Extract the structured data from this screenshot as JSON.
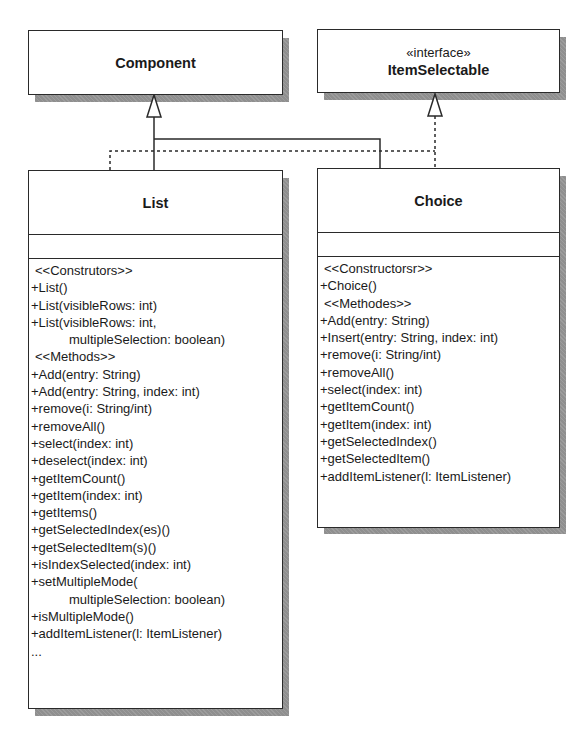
{
  "diagram": {
    "type": "UML class diagram",
    "classes": {
      "component": {
        "name": "Component"
      },
      "item_selectable": {
        "stereotype": "«interface»",
        "name": "ItemSelectable"
      },
      "list": {
        "name": "List",
        "attributes": [],
        "operations": [
          {
            "text": "<<Construtors>>",
            "kind": "stereotype"
          },
          {
            "text": "+List()"
          },
          {
            "text": "+List(visibleRows: int)"
          },
          {
            "text": "+List(visibleRows: int,"
          },
          {
            "text": "multipleSelection: boolean)",
            "kind": "continuation"
          },
          {
            "text": "<<Methods>>",
            "kind": "stereotype"
          },
          {
            "text": "+Add(entry: String)"
          },
          {
            "text": "+Add(entry: String, index: int)"
          },
          {
            "text": "+remove(i: String/int)"
          },
          {
            "text": "+removeAll()"
          },
          {
            "text": "+select(index: int)"
          },
          {
            "text": "+deselect(index: int)"
          },
          {
            "text": "+getItemCount()"
          },
          {
            "text": "+getItem(index: int)"
          },
          {
            "text": "+getItems()"
          },
          {
            "text": "+getSelectedIndex(es)()"
          },
          {
            "text": "+getSelectedItem(s)()"
          },
          {
            "text": "+isIndexSelected(index: int)"
          },
          {
            "text": "+setMultipleMode("
          },
          {
            "text": "multipleSelection: boolean)",
            "kind": "continuation"
          },
          {
            "text": "+isMultipleMode()"
          },
          {
            "text": "+addItemListener(l: ItemListener)"
          },
          {
            "text": "..."
          }
        ]
      },
      "choice": {
        "name": "Choice",
        "attributes": [],
        "operations": [
          {
            "text": "<<Constructorsr>>",
            "kind": "stereotype"
          },
          {
            "text": "+Choice()"
          },
          {
            "text": "<<Methodes>>",
            "kind": "stereotype"
          },
          {
            "text": "+Add(entry: String)"
          },
          {
            "text": "+Insert(entry: String, index: int)"
          },
          {
            "text": "+remove(i: String/int)"
          },
          {
            "text": "+removeAll()"
          },
          {
            "text": "+select(index: int)"
          },
          {
            "text": "+getItemCount()"
          },
          {
            "text": "+getItem(index: int)"
          },
          {
            "text": "+getSelectedIndex()"
          },
          {
            "text": "+getSelectedItem()"
          },
          {
            "text": "+addItemListener(l: ItemListener)"
          }
        ]
      }
    },
    "relations": [
      {
        "from": "List",
        "to": "Component",
        "type": "generalization"
      },
      {
        "from": "Choice",
        "to": "Component",
        "type": "generalization"
      },
      {
        "from": "List",
        "to": "ItemSelectable",
        "type": "realization"
      },
      {
        "from": "Choice",
        "to": "ItemSelectable",
        "type": "realization"
      }
    ],
    "colors": {
      "line": "#2a2a2a",
      "shadow": "#8f8f8f",
      "fill": "#ffffff"
    }
  }
}
